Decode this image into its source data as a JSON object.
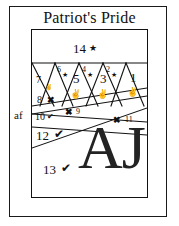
{
  "document": {
    "title": "Patriot's Pride",
    "margin_note": "af"
  },
  "colors": {
    "ink": "#111111",
    "frame": "#1a1a1a",
    "monogram": "#232323",
    "background": "#ffffff"
  },
  "monogram": {
    "text": "AJ"
  },
  "symbols": {
    "star": "★",
    "star_outline": "☆",
    "cross": "✖",
    "check": "✔",
    "hand": "✌"
  },
  "pieces": [
    {
      "id": "p14",
      "number": "14",
      "symbol": "★",
      "symbol_name": "star-icon",
      "band": "top"
    },
    {
      "id": "p1",
      "number": "1",
      "symbol": "✌",
      "symbol_name": "hand-icon",
      "band": "triangles"
    },
    {
      "id": "p2",
      "number": "2",
      "symbol": "★",
      "symbol_name": "star-icon",
      "band": "triangles"
    },
    {
      "id": "p3",
      "number": "3",
      "symbol": "✌",
      "symbol_name": "hand-icon",
      "band": "triangles"
    },
    {
      "id": "p4",
      "number": "4",
      "symbol": "★",
      "symbol_name": "star-icon",
      "band": "triangles"
    },
    {
      "id": "p5",
      "number": "5",
      "symbol": "✌",
      "symbol_name": "hand-icon",
      "band": "triangles"
    },
    {
      "id": "p6",
      "number": "6",
      "symbol": "★",
      "symbol_name": "star-icon",
      "band": "triangles"
    },
    {
      "id": "p7",
      "number": "7",
      "symbol": "✌",
      "symbol_name": "hand-icon",
      "band": "triangles"
    },
    {
      "id": "p8",
      "number": "8",
      "symbol": "✖",
      "symbol_name": "cross-icon",
      "band": "triangles"
    },
    {
      "id": "p9",
      "number": "9",
      "symbol": "✖",
      "symbol_name": "cross-icon",
      "band": "stripes"
    },
    {
      "id": "p10",
      "number": "10",
      "symbol": "✔",
      "symbol_name": "check-icon",
      "band": "stripes"
    },
    {
      "id": "p11",
      "number": "11",
      "symbol": "✖",
      "symbol_name": "cross-icon",
      "band": "stripes"
    },
    {
      "id": "p12",
      "number": "12",
      "symbol": "✔",
      "symbol_name": "check-icon",
      "band": "stripes"
    },
    {
      "id": "p13",
      "number": "13",
      "symbol": "✔",
      "symbol_name": "check-icon",
      "band": "bottom"
    }
  ]
}
